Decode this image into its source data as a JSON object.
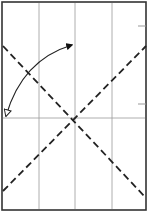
{
  "diagram": {
    "background": "#ffffff",
    "paper": {
      "x": 2,
      "y": 2,
      "width": 144,
      "height": 208,
      "border_color": "#333333",
      "border_width": 1.6
    },
    "creases": {
      "color": "#999999",
      "width": 0.8,
      "vertical_x": [
        39,
        75,
        112
      ],
      "horizontal_y": [
        118
      ]
    },
    "valley_folds": {
      "color": "#222222",
      "width": 1.8,
      "dash": "7 4",
      "lines": [
        {
          "x1": 3,
          "y1": 46,
          "x2": 146,
          "y2": 198
        },
        {
          "x1": 3,
          "y1": 191,
          "x2": 146,
          "y2": 46
        }
      ],
      "intersection": {
        "x": 75,
        "y": 118
      }
    },
    "edge_ticks": {
      "color": "#999999",
      "marks": [
        {
          "x1": 138,
          "y1": 26,
          "x2": 146,
          "y2": 26
        },
        {
          "x1": 138,
          "y1": 104,
          "x2": 146,
          "y2": 104
        }
      ]
    },
    "fold_arrow": {
      "color": "#222222",
      "width": 1.2,
      "start": {
        "x": 6,
        "y": 116
      },
      "end": {
        "x": 72,
        "y": 45
      },
      "start_head": "hollow",
      "end_head": "filled"
    }
  }
}
